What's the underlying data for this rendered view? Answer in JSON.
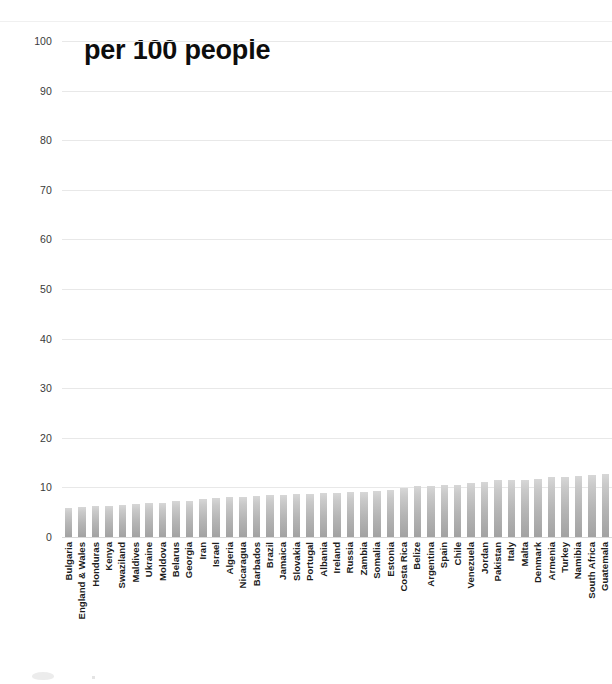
{
  "chart_data": {
    "type": "bar",
    "title": "per 100 people",
    "xlabel": "",
    "ylabel": "",
    "ylim": [
      0,
      100
    ],
    "yticks": [
      0,
      10,
      20,
      30,
      40,
      50,
      60,
      70,
      80,
      90,
      100
    ],
    "grid": true,
    "legend": null,
    "bar_color": "#b9b9b9",
    "categories": [
      "Bulgaria",
      "England & Wales",
      "Honduras",
      "Kenya",
      "Swaziland",
      "Maldives",
      "Ukraine",
      "Moldova",
      "Belarus",
      "Georgia",
      "Iran",
      "Israel",
      "Algeria",
      "Nicaragua",
      "Barbados",
      "Brazil",
      "Jamaica",
      "Slovakia",
      "Portugal",
      "Albania",
      "Ireland",
      "Russia",
      "Zambia",
      "Somalia",
      "Estonia",
      "Costa Rica",
      "Belize",
      "Argentina",
      "Spain",
      "Chile",
      "Venezuela",
      "Jordan",
      "Pakistan",
      "Italy",
      "Malta",
      "Denmark",
      "Armenia",
      "Turkey",
      "Namibia",
      "South Africa",
      "Guatemala"
    ],
    "values": [
      5.9,
      6.0,
      6.2,
      6.3,
      6.4,
      6.6,
      6.8,
      6.9,
      7.2,
      7.3,
      7.6,
      7.8,
      8.0,
      8.1,
      8.3,
      8.4,
      8.5,
      8.6,
      8.7,
      8.8,
      8.9,
      9.0,
      9.1,
      9.3,
      9.5,
      9.9,
      10.2,
      10.2,
      10.4,
      10.5,
      10.8,
      11.0,
      11.4,
      11.4,
      11.5,
      11.6,
      12.0,
      12.1,
      12.3,
      12.5,
      12.8
    ]
  },
  "axis": {
    "y_tick_labels": [
      "100",
      "90",
      "80",
      "70",
      "60",
      "50",
      "40",
      "30",
      "20",
      "10",
      "0"
    ]
  }
}
